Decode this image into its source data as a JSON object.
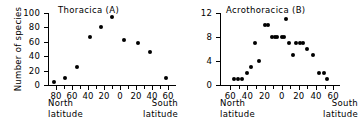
{
  "figure": {
    "shared_ylabel": "Number of species",
    "north_caption_line1": "North",
    "north_caption_line2": "latitude",
    "south_caption_line1": "South",
    "south_caption_line2": "latitude",
    "ink_color": "#000000",
    "background_color": "#ffffff"
  },
  "chart_data": [
    {
      "type": "scatter",
      "panel": "A",
      "title": "Thoracica  (A)",
      "xlabel": "Latitude (North → South)",
      "ylabel": "Number of species",
      "xlim": [
        -90,
        70
      ],
      "ylim": [
        0,
        100
      ],
      "xticks": [
        -80,
        -60,
        -40,
        -20,
        0,
        20,
        40,
        60
      ],
      "xticklabels": [
        "80",
        "60",
        "40",
        "20",
        "0",
        "20",
        "40",
        "60"
      ],
      "yticks": [
        0,
        20,
        40,
        60,
        80,
        100
      ],
      "yticklabels": [
        "0",
        "20",
        "40",
        "60",
        "80",
        "100"
      ],
      "xtick_note": "Negative x = North latitude, positive x = South latitude",
      "grid": false,
      "legend": "none",
      "points": [
        {
          "x": -82,
          "y": 4
        },
        {
          "x": -69,
          "y": 10
        },
        {
          "x": -54,
          "y": 25
        },
        {
          "x": -38,
          "y": 66
        },
        {
          "x": -24,
          "y": 81
        },
        {
          "x": -10,
          "y": 95
        },
        {
          "x": 5,
          "y": 62
        },
        {
          "x": 22,
          "y": 58
        },
        {
          "x": 38,
          "y": 46
        },
        {
          "x": 57,
          "y": 10
        }
      ]
    },
    {
      "type": "scatter",
      "panel": "B",
      "title": "Acrothoracica  (B)",
      "xlabel": "Latitude (North → South)",
      "ylabel": "Number of species",
      "xlim": [
        -72,
        68
      ],
      "ylim": [
        0,
        12
      ],
      "xticks": [
        -60,
        -40,
        -20,
        0,
        20,
        40,
        60
      ],
      "xticklabels": [
        "60",
        "40",
        "20",
        "0",
        "20",
        "40",
        "60"
      ],
      "yticks": [
        0,
        4,
        8,
        12
      ],
      "yticklabels": [
        "0",
        "4",
        "8",
        "12"
      ],
      "xtick_note": "Negative x = North latitude, positive x = South latitude",
      "grid": false,
      "legend": "none",
      "points": [
        {
          "x": -56,
          "y": 1
        },
        {
          "x": -51,
          "y": 1
        },
        {
          "x": -46,
          "y": 1
        },
        {
          "x": -40,
          "y": 2
        },
        {
          "x": -36,
          "y": 3
        },
        {
          "x": -31,
          "y": 7
        },
        {
          "x": -27,
          "y": 4
        },
        {
          "x": -19,
          "y": 10
        },
        {
          "x": -16,
          "y": 10
        },
        {
          "x": -11,
          "y": 8
        },
        {
          "x": -8,
          "y": 8
        },
        {
          "x": -5,
          "y": 8
        },
        {
          "x": 0,
          "y": 8
        },
        {
          "x": 3,
          "y": 8
        },
        {
          "x": 5,
          "y": 11
        },
        {
          "x": 8,
          "y": 7
        },
        {
          "x": 13,
          "y": 5
        },
        {
          "x": 17,
          "y": 7
        },
        {
          "x": 21,
          "y": 7
        },
        {
          "x": 25,
          "y": 7
        },
        {
          "x": 29,
          "y": 6
        },
        {
          "x": 36,
          "y": 5
        },
        {
          "x": 44,
          "y": 2
        },
        {
          "x": 49,
          "y": 2
        },
        {
          "x": 53,
          "y": 1
        }
      ]
    }
  ]
}
